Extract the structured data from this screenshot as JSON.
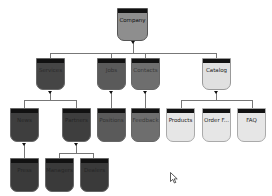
{
  "diagram": {
    "root": {
      "label": "Company",
      "color": "#8e8e8e"
    },
    "level1": [
      {
        "label": "Services",
        "color": "#454545"
      },
      {
        "label": "Jobs",
        "color": "#5a5a5a"
      },
      {
        "label": "Contacts",
        "color": "#6e6e6e"
      },
      {
        "label": "Catalog",
        "color": "#e0e0e0"
      }
    ],
    "level2": [
      {
        "label": "News",
        "color": "#3e3e3e"
      },
      {
        "label": "Partners",
        "color": "#3e3e3e"
      },
      {
        "label": "Positions",
        "color": "#5a5a5a"
      },
      {
        "label": "Feedback",
        "color": "#6e6e6e"
      },
      {
        "label": "Products",
        "color": "#e6e6e6"
      },
      {
        "label": "Order F...",
        "color": "#e6e6e6"
      },
      {
        "label": "FAQ",
        "color": "#e6e6e6"
      }
    ],
    "level3": [
      {
        "label": "Press",
        "color": "#3a3a3a"
      },
      {
        "label": "Managers",
        "color": "#3a3a3a"
      },
      {
        "label": "Dealers",
        "color": "#3a3a3a"
      }
    ]
  }
}
